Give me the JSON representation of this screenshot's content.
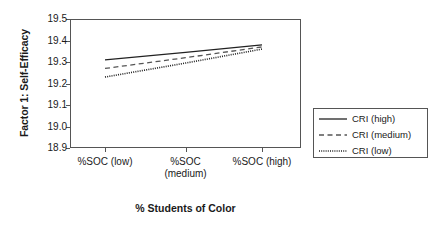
{
  "chart_data": {
    "type": "line",
    "title": "",
    "xlabel": "% Students of Color",
    "ylabel": "Factor 1: Self-Efficacy",
    "categories": [
      "%SOC (low)",
      "%SOC (medium)",
      "%SOC (high)"
    ],
    "x": [
      0,
      1,
      2
    ],
    "ylim": [
      18.9,
      19.5
    ],
    "yticks": [
      "19.5",
      "19.4",
      "19.3",
      "19.2",
      "19.1",
      "19.0",
      "18.9"
    ],
    "ytick_values": [
      19.5,
      19.4,
      19.3,
      19.2,
      19.1,
      19.0,
      18.9
    ],
    "grid": false,
    "legend_position": "right-outside",
    "series": [
      {
        "name": "CRI (high)",
        "style": "solid",
        "color": "#222222",
        "values": [
          19.31,
          19.345,
          19.38
        ]
      },
      {
        "name": "CRI (medium)",
        "style": "dashed",
        "color": "#555555",
        "values": [
          19.27,
          19.32,
          19.37
        ]
      },
      {
        "name": "CRI (low)",
        "style": "dotted",
        "color": "#222222",
        "values": [
          19.23,
          19.295,
          19.36
        ]
      }
    ]
  },
  "legend": {
    "items": [
      {
        "label": "CRI (high)"
      },
      {
        "label": "CRI (medium)"
      },
      {
        "label": "CRI (low)"
      }
    ]
  },
  "axes": {
    "y_title": "Factor 1: Self-Efficacy",
    "x_title": "% Students of Color",
    "y_tick_labels": [
      "19.5",
      "19.4",
      "19.3",
      "19.2",
      "19.1",
      "19.0",
      "18.9"
    ],
    "x_tick_labels": [
      "%SOC (low)",
      "%SOC (medium)",
      "%SOC (high)"
    ]
  }
}
